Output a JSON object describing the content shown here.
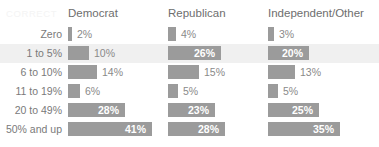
{
  "corner_label": "CORRECT",
  "colors": {
    "bar": "#9b9b9b",
    "band": "#f0f0f0",
    "background": "#ffffff",
    "label_text": "#7a7a7a",
    "header_text": "#6e6e6e",
    "value_inside": "#ffffff",
    "value_outside": "#8a8a8a",
    "corner_text": "#f4f4f4"
  },
  "chart_data": {
    "type": "bar",
    "title": "",
    "xlabel": "",
    "ylabel": "",
    "grid": false,
    "legend": "none",
    "orientation": "horizontal",
    "value_unit": "%",
    "xlim": [
      0,
      50
    ],
    "categories": [
      "Zero",
      "1 to 5%",
      "6 to 10%",
      "11 to 19%",
      "20 to 49%",
      "50% and up"
    ],
    "series": [
      {
        "name": "Democrat",
        "values": [
          2,
          10,
          14,
          6,
          28,
          41
        ]
      },
      {
        "name": "Republican",
        "values": [
          4,
          26,
          15,
          5,
          23,
          28
        ]
      },
      {
        "name": "Independent/Other",
        "values": [
          3,
          20,
          13,
          5,
          25,
          35
        ]
      }
    ],
    "value_labels": [
      [
        "2%",
        "10%",
        "14%",
        "6%",
        "28%",
        "41%"
      ],
      [
        "4%",
        "26%",
        "15%",
        "5%",
        "23%",
        "28%"
      ],
      [
        "3%",
        "20%",
        "13%",
        "5%",
        "25%",
        "35%"
      ]
    ],
    "highlighted_category": "1 to 5%"
  }
}
